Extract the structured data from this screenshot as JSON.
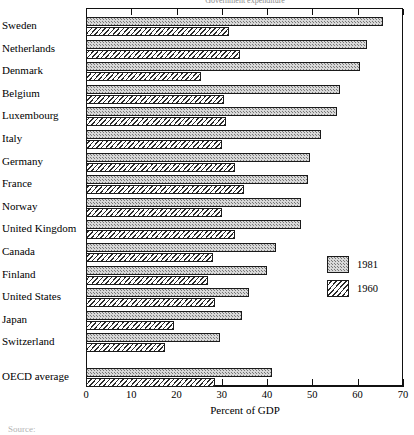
{
  "chart_data": {
    "type": "bar",
    "orientation": "horizontal",
    "title": "Government expenditure",
    "xlabel": "Percent of GDP",
    "ylabel": "",
    "xlim": [
      0,
      70
    ],
    "xticks": [
      0,
      10,
      20,
      30,
      40,
      50,
      60,
      70
    ],
    "xtick_labels": [
      "0",
      "10",
      "20",
      "30",
      "40",
      "50",
      "60",
      "70"
    ],
    "grid": false,
    "legend_position": "center-right",
    "categories": [
      "Sweden",
      "Netherlands",
      "Denmark",
      "Belgium",
      "Luxembourg",
      "Italy",
      "Germany",
      "France",
      "Norway",
      "United Kingdom",
      "Canada",
      "Finland",
      "United States",
      "Japan",
      "Switzerland",
      "OECD average"
    ],
    "series": [
      {
        "name": "1981",
        "values": [
          65.5,
          62.0,
          60.5,
          56.0,
          55.5,
          52.0,
          49.5,
          49.0,
          47.5,
          47.5,
          42.0,
          40.0,
          36.0,
          34.5,
          29.5,
          41.0
        ]
      },
      {
        "name": "1960",
        "values": [
          31.5,
          34.0,
          25.5,
          30.5,
          31.0,
          30.0,
          33.0,
          35.0,
          30.0,
          33.0,
          28.0,
          27.0,
          28.5,
          19.5,
          17.5,
          28.5
        ]
      }
    ]
  },
  "legend": {
    "entries": [
      {
        "label": "1981",
        "pattern": "stipple",
        "color": "#d8d8d8"
      },
      {
        "label": "1960",
        "pattern": "diagonal-hatch",
        "color": "#ffffff"
      }
    ]
  },
  "axis": {
    "x_title": "Percent of GDP"
  },
  "footer": {
    "source": "Source:"
  }
}
